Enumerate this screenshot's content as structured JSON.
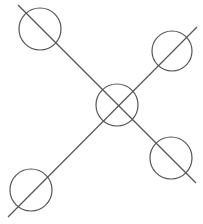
{
  "diagram": {
    "stroke": "#555555",
    "background": "#ffffff",
    "lines": [
      {
        "x1": 18,
        "y1": 5,
        "x2": 196,
        "y2": 183
      },
      {
        "x1": 8,
        "y1": 217,
        "x2": 197,
        "y2": 27
      }
    ],
    "circles": [
      {
        "cx": 40,
        "cy": 29,
        "r": 21
      },
      {
        "cx": 172,
        "cy": 51,
        "r": 20
      },
      {
        "cx": 117,
        "cy": 105,
        "r": 21
      },
      {
        "cx": 171,
        "cy": 158,
        "r": 21
      },
      {
        "cx": 31,
        "cy": 190,
        "r": 21
      }
    ]
  }
}
